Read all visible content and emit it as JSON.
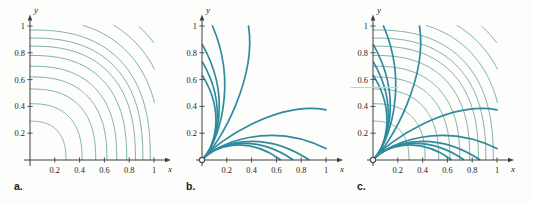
{
  "figure": {
    "colors": {
      "contour": "#7fb0ab",
      "flow": "#2e8b9d",
      "axis": "#3f3f3f",
      "tick_text": "#262626",
      "background": "#fdfdfb",
      "artifact": "#c6ccc9"
    },
    "tick_values": [
      0.2,
      0.4,
      0.6,
      0.8,
      1
    ],
    "tick_labels": [
      "0.2",
      "0.4",
      "0.6",
      "0.8",
      "1"
    ],
    "x_label": "x",
    "y_label": "y",
    "contour_radii": [
      0.29,
      0.42,
      0.53,
      0.62,
      0.7,
      0.78,
      0.85,
      0.91,
      0.97,
      1.05,
      1.14,
      1.24,
      1.34
    ],
    "superellipse_exponent": 2.5,
    "flow_lines": [
      {
        "c1": [
          0.09,
          0.1
        ],
        "c2": [
          0.35,
          0.19
        ],
        "end": [
          0.63,
          0.004
        ]
      },
      {
        "c1": [
          0.1,
          0.11
        ],
        "c2": [
          0.4,
          0.21
        ],
        "end": [
          0.73,
          0.004
        ]
      },
      {
        "c1": [
          0.11,
          0.12
        ],
        "c2": [
          0.47,
          0.24
        ],
        "end": [
          0.86,
          0.004
        ]
      },
      {
        "c1": [
          0.12,
          0.13
        ],
        "c2": [
          0.56,
          0.29
        ],
        "end": [
          1.0,
          0.085
        ]
      },
      {
        "c1": [
          0.13,
          0.155
        ],
        "c2": [
          0.62,
          0.44
        ],
        "end": [
          1.0,
          0.375
        ]
      },
      {
        "c1": [
          0.1,
          0.09
        ],
        "c2": [
          0.19,
          0.35
        ],
        "end": [
          0.004,
          0.63
        ]
      },
      {
        "c1": [
          0.11,
          0.1
        ],
        "c2": [
          0.21,
          0.4
        ],
        "end": [
          0.004,
          0.73
        ]
      },
      {
        "c1": [
          0.12,
          0.11
        ],
        "c2": [
          0.24,
          0.47
        ],
        "end": [
          0.004,
          0.86
        ]
      },
      {
        "c1": [
          0.13,
          0.12
        ],
        "c2": [
          0.29,
          0.56
        ],
        "end": [
          0.085,
          1.0
        ]
      },
      {
        "c1": [
          0.155,
          0.13
        ],
        "c2": [
          0.44,
          0.62
        ],
        "end": [
          0.375,
          1.0
        ]
      }
    ],
    "panels": [
      {
        "id": "a",
        "label": "a.",
        "show_contours": true,
        "show_flows": false,
        "origin_marker": false
      },
      {
        "id": "b",
        "label": "b.",
        "show_contours": false,
        "show_flows": true,
        "origin_marker": true
      },
      {
        "id": "c",
        "label": "c.",
        "show_contours": true,
        "show_flows": true,
        "origin_marker": true
      }
    ],
    "artifact_line": {
      "x": 351,
      "y": 87,
      "width": 47
    }
  },
  "chart_data": [
    {
      "type": "line",
      "title": "a.",
      "xlabel": "x",
      "ylabel": "y",
      "xlim": [
        0,
        1
      ],
      "ylim": [
        0,
        1
      ],
      "xticks": [
        0.2,
        0.4,
        0.6,
        0.8,
        1
      ],
      "yticks": [
        0.2,
        0.4,
        0.6,
        0.8,
        1
      ],
      "grid": false,
      "legend": "none",
      "series": [
        {
          "name": "level curves",
          "description": "concentric superelliptical contour arcs centered at the origin, bulging away from the origin",
          "axis_intercept_radii": [
            0.29,
            0.42,
            0.53,
            0.62,
            0.7,
            0.78,
            0.85,
            0.91,
            0.97
          ],
          "corner_arc_radii": [
            1.05,
            1.14,
            1.24,
            1.34
          ]
        }
      ]
    },
    {
      "type": "line",
      "title": "b.",
      "xlabel": "x",
      "ylabel": "y",
      "xlim": [
        0,
        1
      ],
      "ylim": [
        0,
        1
      ],
      "xticks": [
        0.2,
        0.4,
        0.6,
        0.8,
        1
      ],
      "yticks": [
        0.2,
        0.4,
        0.6,
        0.8,
        1
      ],
      "grid": false,
      "legend": "none",
      "series": [
        {
          "name": "flow lines",
          "description": "10 curves emanating from an open circle at the origin, bundled near the diagonal then fanning out toward both axes",
          "endpoints": [
            [
              0.63,
              0
            ],
            [
              0.73,
              0
            ],
            [
              0.86,
              0
            ],
            [
              1,
              0.085
            ],
            [
              1,
              0.375
            ],
            [
              0,
              0.63
            ],
            [
              0,
              0.73
            ],
            [
              0,
              0.86
            ],
            [
              0.085,
              1
            ],
            [
              0.375,
              1
            ]
          ],
          "origin_marker": true
        }
      ]
    },
    {
      "type": "line",
      "title": "c.",
      "xlabel": "x",
      "ylabel": "y",
      "xlim": [
        0,
        1
      ],
      "ylim": [
        0,
        1
      ],
      "xticks": [
        0.2,
        0.4,
        0.6,
        0.8,
        1
      ],
      "yticks": [
        0.2,
        0.4,
        0.6,
        0.8,
        1
      ],
      "grid": false,
      "legend": "none",
      "description": "overlay of panel a (thin level curves) and panel b (thick flow lines), curves crossing approximately at right angles"
    }
  ]
}
